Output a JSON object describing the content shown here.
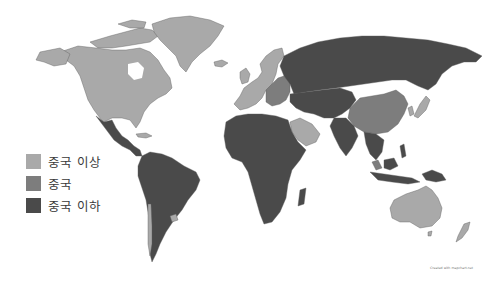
{
  "map": {
    "type": "choropleth world map",
    "colors": {
      "above_china": "#a9a9a9",
      "china": "#7d7d7d",
      "below_china": "#4a4a4a",
      "ocean": "#ffffff",
      "border": "#5c5c5c"
    },
    "regions": [
      {
        "name": "North America (USA, Canada)",
        "category": "above_china"
      },
      {
        "name": "Greenland",
        "category": "above_china"
      },
      {
        "name": "Mexico / Central America",
        "category": "below_china"
      },
      {
        "name": "South America",
        "category": "below_china"
      },
      {
        "name": "Uruguay / Chile",
        "category": "above_china"
      },
      {
        "name": "Western Europe",
        "category": "above_china"
      },
      {
        "name": "Eastern Europe",
        "category": "china"
      },
      {
        "name": "Russia",
        "category": "below_china"
      },
      {
        "name": "Central Asia",
        "category": "below_china"
      },
      {
        "name": "China",
        "category": "china"
      },
      {
        "name": "Japan / South Korea",
        "category": "above_china"
      },
      {
        "name": "Middle East (Gulf)",
        "category": "above_china"
      },
      {
        "name": "Africa",
        "category": "below_china"
      },
      {
        "name": "South Asia",
        "category": "below_china"
      },
      {
        "name": "Southeast Asia",
        "category": "below_china"
      },
      {
        "name": "Malaysia",
        "category": "china"
      },
      {
        "name": "Australia",
        "category": "above_china"
      },
      {
        "name": "New Zealand",
        "category": "above_china"
      }
    ]
  },
  "legend": {
    "items": [
      {
        "label": "중국 이상",
        "color": "#a9a9a9"
      },
      {
        "label": "중국",
        "color": "#7d7d7d"
      },
      {
        "label": "중국 이하",
        "color": "#4a4a4a"
      }
    ]
  },
  "credit": "Created with mapchart.net"
}
